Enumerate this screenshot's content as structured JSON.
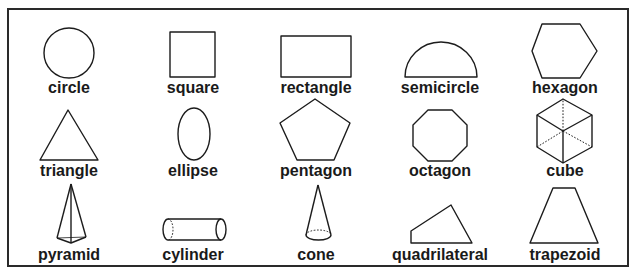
{
  "shapes": [
    {
      "name": "circle",
      "label": "circle"
    },
    {
      "name": "square",
      "label": "square"
    },
    {
      "name": "rectangle",
      "label": "rectangle"
    },
    {
      "name": "semicircle",
      "label": "semicircle"
    },
    {
      "name": "hexagon",
      "label": "hexagon"
    },
    {
      "name": "triangle",
      "label": "triangle"
    },
    {
      "name": "ellipse",
      "label": "ellipse"
    },
    {
      "name": "pentagon",
      "label": "pentagon"
    },
    {
      "name": "octagon",
      "label": "octagon"
    },
    {
      "name": "cube",
      "label": "cube"
    },
    {
      "name": "pyramid",
      "label": "pyramid"
    },
    {
      "name": "cylinder",
      "label": "cylinder"
    },
    {
      "name": "cone",
      "label": "cone"
    },
    {
      "name": "quadrilateral",
      "label": "quadrilateral"
    },
    {
      "name": "trapezoid",
      "label": "trapezoid"
    }
  ],
  "colors": {
    "stroke": "#1c1c1c",
    "background": "#ffffff",
    "text": "#1a1a1a"
  }
}
